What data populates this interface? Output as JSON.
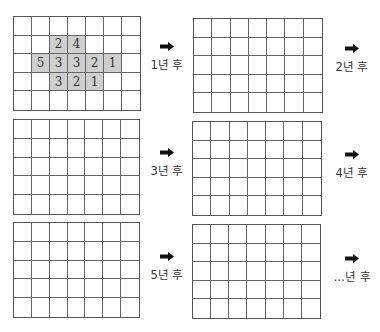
{
  "panels": [
    {
      "id": "initial",
      "cells": [
        [
          "",
          "",
          "",
          "",
          "",
          "",
          ""
        ],
        [
          "",
          "",
          "2",
          "4",
          "",
          "",
          ""
        ],
        [
          "",
          "5",
          "3",
          "3",
          "2",
          "1",
          ""
        ],
        [
          "",
          "",
          "3",
          "2",
          "1",
          "",
          ""
        ],
        [
          "",
          "",
          "",
          "",
          "",
          "",
          ""
        ]
      ],
      "step_label": "1년 후"
    },
    {
      "id": "year-1",
      "cells": [
        [
          "",
          "",
          "",
          "",
          "",
          "",
          ""
        ],
        [
          "",
          "",
          "",
          "",
          "",
          "",
          ""
        ],
        [
          "",
          "",
          "",
          "",
          "",
          "",
          ""
        ],
        [
          "",
          "",
          "",
          "",
          "",
          "",
          ""
        ],
        [
          "",
          "",
          "",
          "",
          "",
          "",
          ""
        ]
      ],
      "step_label": "2년 후"
    },
    {
      "id": "year-2",
      "cells": [
        [
          "",
          "",
          "",
          "",
          "",
          "",
          ""
        ],
        [
          "",
          "",
          "",
          "",
          "",
          "",
          ""
        ],
        [
          "",
          "",
          "",
          "",
          "",
          "",
          ""
        ],
        [
          "",
          "",
          "",
          "",
          "",
          "",
          ""
        ],
        [
          "",
          "",
          "",
          "",
          "",
          "",
          ""
        ]
      ],
      "step_label": "3년 후"
    },
    {
      "id": "year-3",
      "cells": [
        [
          "",
          "",
          "",
          "",
          "",
          "",
          ""
        ],
        [
          "",
          "",
          "",
          "",
          "",
          "",
          ""
        ],
        [
          "",
          "",
          "",
          "",
          "",
          "",
          ""
        ],
        [
          "",
          "",
          "",
          "",
          "",
          "",
          ""
        ],
        [
          "",
          "",
          "",
          "",
          "",
          "",
          ""
        ]
      ],
      "step_label": "4년 후"
    },
    {
      "id": "year-4",
      "cells": [
        [
          "",
          "",
          "",
          "",
          "",
          "",
          ""
        ],
        [
          "",
          "",
          "",
          "",
          "",
          "",
          ""
        ],
        [
          "",
          "",
          "",
          "",
          "",
          "",
          ""
        ],
        [
          "",
          "",
          "",
          "",
          "",
          "",
          ""
        ],
        [
          "",
          "",
          "",
          "",
          "",
          "",
          ""
        ]
      ],
      "step_label": "5년 후"
    },
    {
      "id": "year-5",
      "cells": [
        [
          "",
          "",
          "",
          "",
          "",
          "",
          ""
        ],
        [
          "",
          "",
          "",
          "",
          "",
          "",
          ""
        ],
        [
          "",
          "",
          "",
          "",
          "",
          "",
          ""
        ],
        [
          "",
          "",
          "",
          "",
          "",
          "",
          ""
        ],
        [
          "",
          "",
          "",
          "",
          "",
          "",
          ""
        ]
      ],
      "step_label": "…년 후"
    }
  ],
  "colors": {
    "shaded_cell": "#cfcfcf",
    "grid_line": "#666666",
    "arrow": "#111111"
  },
  "grid": {
    "rows": 5,
    "cols": 7
  }
}
